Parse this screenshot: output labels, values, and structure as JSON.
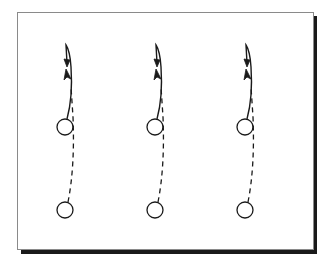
{
  "diagram": {
    "colors": {
      "stroke": "#1a1a1a",
      "frame_border": "#8a8a8a",
      "shadow": "#1a1a1a",
      "background": "#ffffff"
    },
    "units": [
      {
        "id": "unit-1",
        "players": [
          "upper-player",
          "lower-player"
        ],
        "routes": [
          "solid-curl-route",
          "dashed-route"
        ]
      },
      {
        "id": "unit-2",
        "players": [
          "upper-player",
          "lower-player"
        ],
        "routes": [
          "solid-curl-route",
          "dashed-route"
        ]
      },
      {
        "id": "unit-3",
        "players": [
          "upper-player",
          "lower-player"
        ],
        "routes": [
          "solid-curl-route",
          "dashed-route"
        ]
      }
    ]
  }
}
